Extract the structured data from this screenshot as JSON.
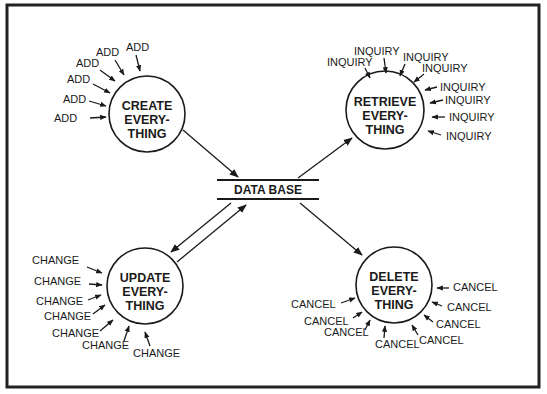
{
  "diagram": {
    "data_store": {
      "label": "DATA BASE"
    },
    "processes": [
      {
        "id": "create",
        "lines": [
          "CREATE",
          "EVERY-",
          "THING"
        ]
      },
      {
        "id": "retrieve",
        "lines": [
          "RETRIEVE",
          "EVERY-",
          "THING"
        ]
      },
      {
        "id": "update",
        "lines": [
          "UPDATE",
          "EVERY-",
          "THING"
        ]
      },
      {
        "id": "delete",
        "lines": [
          "DELETE",
          "EVERY-",
          "THING"
        ]
      }
    ],
    "inputs": {
      "create": [
        "ADD",
        "ADD",
        "ADD",
        "ADD",
        "ADD",
        "ADD"
      ],
      "retrieve": [
        "INQUIRY",
        "INQUIRY",
        "INQUIRY",
        "INQUIRY",
        "INQUIRY",
        "INQUIRY",
        "INQUIRY",
        "INQUIRY"
      ],
      "update": [
        "CHANGE",
        "CHANGE",
        "CHANGE",
        "CHANGE",
        "CHANGE",
        "CHANGE",
        "CHANGE"
      ],
      "delete": [
        "CANCEL",
        "CANCEL",
        "CANCEL",
        "CANCEL",
        "CANCEL",
        "CANCEL",
        "CANCEL",
        "CANCEL"
      ]
    },
    "flows": [
      {
        "from": "CREATE EVERYTHING",
        "to": "DATA BASE"
      },
      {
        "from": "DATA BASE",
        "to": "RETRIEVE EVERYTHING"
      },
      {
        "from": "DATA BASE",
        "to": "UPDATE EVERYTHING"
      },
      {
        "from": "UPDATE EVERYTHING",
        "to": "DATA BASE"
      },
      {
        "from": "DATA BASE",
        "to": "DELETE EVERYTHING"
      }
    ],
    "colors": {
      "ink": "#1a1a1a",
      "frame": "#222222",
      "background": "#ffffff"
    }
  }
}
